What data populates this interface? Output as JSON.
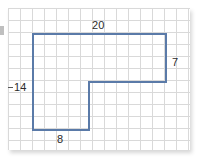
{
  "figure": {
    "kind": "composite-rectilinear-polygon"
  },
  "grid": {
    "cell_size": 12,
    "columns": 15,
    "rows": 12,
    "line_color": "#d9d9d9",
    "background_color": "#ffffff",
    "origin_x": 8,
    "origin_y": 8,
    "width": 182,
    "height": 142
  },
  "shape": {
    "stroke_color": "#5a7aa8",
    "stroke_width": 2,
    "fill": "none",
    "points": "33,34 166,34 166,82 89,82 89,130 33,130",
    "vertices": [
      {
        "name": "top-left",
        "x": 33,
        "y": 34
      },
      {
        "name": "top-right",
        "x": 166,
        "y": 34
      },
      {
        "name": "right-lower",
        "x": 166,
        "y": 82
      },
      {
        "name": "inner-notch",
        "x": 89,
        "y": 82
      },
      {
        "name": "lower-leg-right",
        "x": 89,
        "y": 130
      },
      {
        "name": "bottom-left",
        "x": 33,
        "y": 130
      }
    ]
  },
  "labels": {
    "top": "20",
    "right": "7",
    "left": "14",
    "bottom": "8"
  }
}
